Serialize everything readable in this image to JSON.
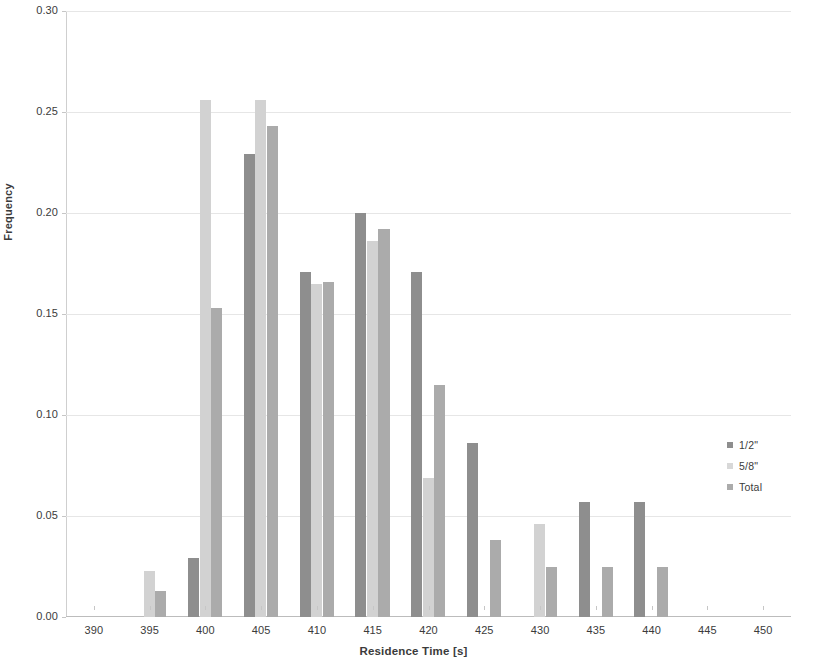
{
  "chart_data": {
    "type": "bar",
    "title": "",
    "xlabel": "Residence Time [s]",
    "ylabel": "Frequency",
    "xlim": [
      387.5,
      452.5
    ],
    "ylim": [
      0.0,
      0.3
    ],
    "xticks": [
      "390",
      "395",
      "400",
      "405",
      "410",
      "415",
      "420",
      "425",
      "430",
      "435",
      "440",
      "445",
      "450"
    ],
    "xtick_values": [
      390,
      395,
      400,
      405,
      410,
      415,
      420,
      425,
      430,
      435,
      440,
      445,
      450
    ],
    "yticks": [
      "0.00",
      "0.05",
      "0.10",
      "0.15",
      "0.20",
      "0.25",
      "0.30"
    ],
    "ytick_values": [
      0.0,
      0.05,
      0.1,
      0.15,
      0.2,
      0.25,
      0.3
    ],
    "grid": "horizontal",
    "legend_position": "right",
    "categories": [
      390,
      395,
      400,
      405,
      410,
      415,
      420,
      425,
      430,
      435,
      440,
      445,
      450
    ],
    "series": [
      {
        "name": "1/2\"",
        "color": "#8e8e8e",
        "values": [
          0,
          0,
          0.029,
          0.229,
          0.171,
          0.2,
          0.171,
          0.086,
          0,
          0.057,
          0.057,
          0,
          0
        ]
      },
      {
        "name": "5/8\"",
        "color": "#d2d2d2",
        "values": [
          0,
          0.023,
          0.256,
          0.256,
          0.165,
          0.186,
          0.069,
          0,
          0.046,
          0,
          0,
          0,
          0
        ]
      },
      {
        "name": "Total",
        "color": "#ababab",
        "values": [
          0,
          0.013,
          0.153,
          0.243,
          0.166,
          0.192,
          0.115,
          0.038,
          0.025,
          0.025,
          0.025,
          0,
          0
        ]
      }
    ]
  },
  "legend": {
    "items": [
      {
        "label": "1/2\"",
        "color": "#8e8e8e"
      },
      {
        "label": "5/8\"",
        "color": "#d8d8d8"
      },
      {
        "label": "Total",
        "color": "#ababab"
      }
    ]
  }
}
